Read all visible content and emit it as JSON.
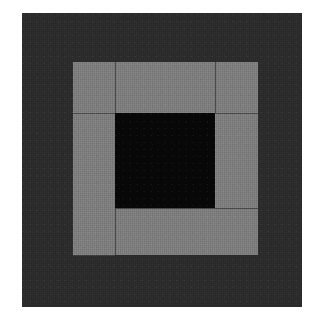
{
  "image": {
    "title": "Log Cabin Quilt Block",
    "description": "Concentric square quilt block: dark charcoal outer border, medium gray inner log-cabin strips, solid black center square, on a white background.",
    "type": "quilt-block",
    "width": 319,
    "height": 326,
    "background_color": "#ffffff"
  },
  "palette": {
    "background": "#ffffff",
    "outer_border": "#2b2b2b",
    "inner_strip": "#7d7d7d",
    "center": "#070707",
    "seam": "#3f3f3f"
  },
  "regions": [
    {
      "name": "outer-border",
      "label": "Outer dark border",
      "color": "#2b2b2b",
      "x": 22,
      "y": 13,
      "w": 280,
      "h": 294
    },
    {
      "name": "log-strip-top",
      "label": "Top gray log strip",
      "color": "#7d7d7d",
      "x": 73,
      "y": 62,
      "w": 185,
      "h": 51
    },
    {
      "name": "log-strip-left",
      "label": "Left gray log strip",
      "color": "#7d7d7d",
      "x": 73,
      "y": 113,
      "w": 42,
      "h": 142
    },
    {
      "name": "log-strip-right",
      "label": "Right gray log strip",
      "color": "#7d7d7d",
      "x": 215,
      "y": 113,
      "w": 43,
      "h": 95
    },
    {
      "name": "log-strip-bottom",
      "label": "Bottom gray log strip",
      "color": "#7d7d7d",
      "x": 115,
      "y": 208,
      "w": 143,
      "h": 47
    },
    {
      "name": "center-square",
      "label": "Black center square",
      "color": "#070707",
      "x": 115,
      "y": 113,
      "w": 100,
      "h": 95
    }
  ],
  "seams": [
    {
      "name": "seam-top-left-vertical",
      "x": 115,
      "y": 62,
      "w": 1,
      "h": 51
    },
    {
      "name": "seam-top-right-vertical",
      "x": 215,
      "y": 62,
      "w": 1,
      "h": 51
    },
    {
      "name": "seam-left-horizontal",
      "x": 73,
      "y": 113,
      "w": 42,
      "h": 1
    },
    {
      "name": "seam-right-horizontal",
      "x": 215,
      "y": 113,
      "w": 43,
      "h": 1
    },
    {
      "name": "seam-bottom-left-vertical",
      "x": 115,
      "y": 208,
      "w": 1,
      "h": 47
    },
    {
      "name": "seam-bottom-horizontal",
      "x": 115,
      "y": 208,
      "w": 143,
      "h": 1
    },
    {
      "name": "seam-left-bottom-horizontal",
      "x": 73,
      "y": 255,
      "w": 42,
      "h": 1
    }
  ]
}
